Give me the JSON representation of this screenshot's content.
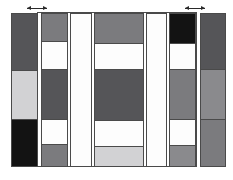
{
  "figure": {
    "title": "",
    "background": "#ffffff",
    "stroke": "#4a4a4a",
    "width": 233,
    "height": 180
  },
  "palette": {
    "black": "#131313",
    "dark_gray": "#555558",
    "medium_gray": "#7b7b7e",
    "mid_gray": "#8a8a8d",
    "light_gray": "#d2d2d4",
    "pale_gray": "#e2e2e3",
    "white": "#fdfdfd"
  },
  "markers": [
    {
      "name": "left-arrow-marker",
      "x": 27,
      "y": 6,
      "width": 20,
      "glyph": "double-arrow"
    },
    {
      "name": "right-arrow-marker",
      "x": 185,
      "y": 6,
      "width": 20,
      "glyph": "double-arrow"
    }
  ],
  "outer_frame": {
    "x": 37,
    "y": 12,
    "width": 160,
    "height": 155
  },
  "columns": [
    {
      "name": "column-1",
      "x": 11,
      "y": 13,
      "width": 27,
      "height": 154,
      "segments": [
        {
          "label": "seg-1-1",
          "top": 0,
          "height": 56,
          "color": "#555558"
        },
        {
          "label": "seg-1-2",
          "top": 56,
          "height": 49,
          "color": "#d2d2d4"
        },
        {
          "label": "seg-1-3",
          "top": 105,
          "height": 49,
          "color": "#131313"
        }
      ]
    },
    {
      "name": "column-2",
      "x": 41,
      "y": 13,
      "width": 27,
      "height": 154,
      "segments": [
        {
          "label": "seg-2-1",
          "top": 0,
          "height": 27,
          "color": "#7b7b7e"
        },
        {
          "label": "seg-2-2",
          "top": 27,
          "height": 28,
          "color": "#fdfdfd"
        },
        {
          "label": "seg-2-3",
          "top": 55,
          "height": 50,
          "color": "#555558"
        },
        {
          "label": "seg-2-4",
          "top": 105,
          "height": 25,
          "color": "#fdfdfd"
        },
        {
          "label": "seg-2-5",
          "top": 130,
          "height": 24,
          "color": "#7b7b7e"
        }
      ]
    },
    {
      "name": "column-3",
      "x": 70,
      "y": 13,
      "width": 22,
      "height": 154,
      "segments": [
        {
          "label": "seg-3-1",
          "top": 0,
          "height": 154,
          "color": "#fdfdfd"
        }
      ]
    },
    {
      "name": "column-4",
      "x": 94,
      "y": 13,
      "width": 50,
      "height": 154,
      "segments": [
        {
          "label": "seg-4-1",
          "top": 0,
          "height": 29,
          "color": "#7b7b7e"
        },
        {
          "label": "seg-4-2",
          "top": 29,
          "height": 26,
          "color": "#fdfdfd"
        },
        {
          "label": "seg-4-3",
          "top": 55,
          "height": 51,
          "color": "#555558"
        },
        {
          "label": "seg-4-4",
          "top": 106,
          "height": 26,
          "color": "#fdfdfd"
        },
        {
          "label": "seg-4-5",
          "top": 132,
          "height": 22,
          "color": "#d2d2d4"
        }
      ]
    },
    {
      "name": "column-5",
      "x": 146,
      "y": 13,
      "width": 21,
      "height": 154,
      "segments": [
        {
          "label": "seg-5-1",
          "top": 0,
          "height": 154,
          "color": "#fdfdfd"
        }
      ]
    },
    {
      "name": "column-6",
      "x": 169,
      "y": 13,
      "width": 27,
      "height": 154,
      "segments": [
        {
          "label": "seg-6-1",
          "top": 0,
          "height": 29,
          "color": "#131313"
        },
        {
          "label": "seg-6-2",
          "top": 29,
          "height": 26,
          "color": "#fdfdfd"
        },
        {
          "label": "seg-6-3",
          "top": 55,
          "height": 50,
          "color": "#7b7b7e"
        },
        {
          "label": "seg-6-4",
          "top": 105,
          "height": 26,
          "color": "#fdfdfd"
        },
        {
          "label": "seg-6-5",
          "top": 131,
          "height": 23,
          "color": "#8a8a8d"
        }
      ]
    },
    {
      "name": "column-7",
      "x": 200,
      "y": 13,
      "width": 26,
      "height": 154,
      "segments": [
        {
          "label": "seg-7-1",
          "top": 0,
          "height": 55,
          "color": "#555558"
        },
        {
          "label": "seg-7-2",
          "top": 55,
          "height": 50,
          "color": "#8a8a8d"
        },
        {
          "label": "seg-7-3",
          "top": 105,
          "height": 49,
          "color": "#7b7b7e"
        }
      ]
    }
  ]
}
